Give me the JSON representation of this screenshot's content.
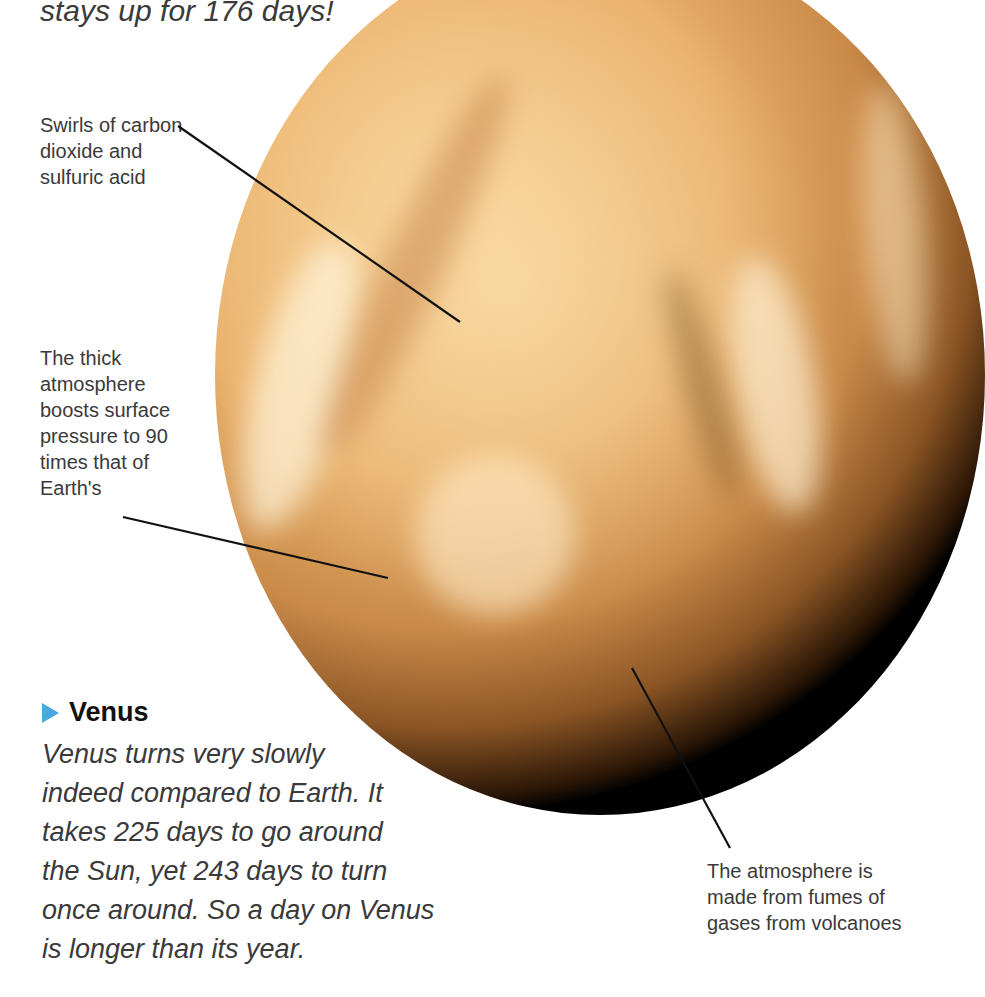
{
  "intro_fragment": "stays up for 176 days!",
  "labels": {
    "swirls": [
      "Swirls of carbon",
      "dioxide and",
      "sulfuric acid"
    ],
    "pressure": [
      "The thick",
      "atmosphere",
      "boosts surface",
      "pressure to 90",
      "times that of",
      "Earth's"
    ],
    "volcanoes": [
      "The atmosphere is",
      "made from fumes of",
      "gases from volcanoes"
    ]
  },
  "section": {
    "heading": "Venus",
    "bullet_color": "#4aa8e0",
    "lines": [
      "Venus turns very slowly",
      "indeed compared to Earth. It",
      "takes 225 days to go around",
      "the Sun, yet 243 days to turn",
      "once around. So a day on Venus",
      "is longer than its year."
    ]
  }
}
